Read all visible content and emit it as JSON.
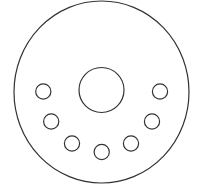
{
  "diagram": {
    "background": "#ffffff",
    "stroke_color": "#333333",
    "stroke_width": 1.2,
    "outer_circle": {
      "cx": 101.5,
      "cy": 92,
      "rx": 87.5,
      "ry": 91
    },
    "center_circle": {
      "cx": 101.5,
      "cy": 90,
      "r": 22.5
    },
    "small_circles": [
      {
        "cx": 43.3,
        "cy": 91.5,
        "r": 7.6
      },
      {
        "cx": 51.2,
        "cy": 121.5,
        "r": 7.6
      },
      {
        "cx": 72.0,
        "cy": 143.5,
        "r": 7.6
      },
      {
        "cx": 101.7,
        "cy": 152.0,
        "r": 7.6
      },
      {
        "cx": 131.0,
        "cy": 143.5,
        "r": 7.6
      },
      {
        "cx": 152.0,
        "cy": 121.5,
        "r": 7.6
      },
      {
        "cx": 160.0,
        "cy": 91.5,
        "r": 7.6
      }
    ]
  }
}
